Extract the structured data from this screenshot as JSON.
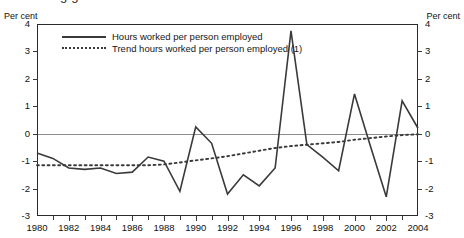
{
  "title_partial": "g                    g",
  "axis_unit_left": "Per cent",
  "axis_unit_right": "Per cent",
  "legend": [
    {
      "label": "Hours worked per person employed",
      "style": "solid"
    },
    {
      "label": "Trend hours worked per person employed (1)",
      "style": "dotted"
    }
  ],
  "y_axis": {
    "ticks": [
      4,
      3,
      2,
      1,
      0,
      -1,
      -2,
      -3
    ],
    "tick_labels": [
      "4",
      "3",
      "2",
      "1",
      "0",
      "-1",
      "-2",
      "-3"
    ],
    "min": -3,
    "max": 4
  },
  "x_axis": {
    "tick_labels": [
      "1980",
      "1982",
      "1984",
      "1986",
      "1988",
      "1990",
      "1992",
      "1994",
      "1996",
      "1998",
      "2000",
      "2002",
      "2004"
    ],
    "min": 1980,
    "max": 2004
  },
  "colors": {
    "series_line": "#3a3a3a",
    "trend_line": "#3a3a3a",
    "zero_line": "#8d8d8d",
    "frame": "#2b2b2b",
    "background": "#ffffff"
  },
  "chart_data": {
    "type": "line",
    "title": "",
    "xlabel": "",
    "ylabel": "Per cent",
    "ylim": [
      -3,
      4
    ],
    "xlim": [
      1980,
      2004
    ],
    "grid": false,
    "legend_position": "top-left-inside",
    "x": [
      1980,
      1981,
      1982,
      1983,
      1984,
      1985,
      1986,
      1987,
      1988,
      1989,
      1990,
      1991,
      1992,
      1993,
      1994,
      1995,
      1996,
      1997,
      1998,
      1999,
      2000,
      2001,
      2002,
      2003,
      2004
    ],
    "series": [
      {
        "name": "Hours worked per person employed",
        "style": "solid",
        "values": [
          -0.7,
          -0.9,
          -1.25,
          -1.3,
          -1.25,
          -1.45,
          -1.4,
          -0.85,
          -1.0,
          -2.1,
          0.25,
          -0.35,
          -2.2,
          -1.5,
          -1.9,
          -1.25,
          3.75,
          -0.4,
          -0.85,
          -1.35,
          1.45,
          -0.45,
          -2.3,
          1.2,
          0.2
        ]
      },
      {
        "name": "Trend hours worked per person employed (1)",
        "style": "dotted",
        "values": [
          -1.15,
          -1.15,
          -1.15,
          -1.15,
          -1.15,
          -1.15,
          -1.15,
          -1.15,
          -1.12,
          -1.05,
          -0.97,
          -0.9,
          -0.82,
          -0.72,
          -0.62,
          -0.52,
          -0.45,
          -0.4,
          -0.35,
          -0.3,
          -0.22,
          -0.16,
          -0.1,
          -0.05,
          -0.02
        ]
      }
    ]
  }
}
